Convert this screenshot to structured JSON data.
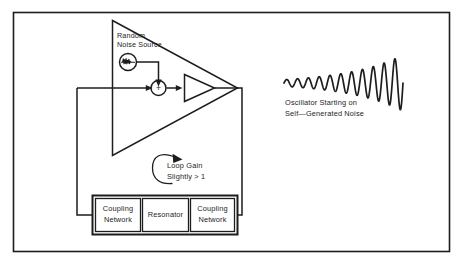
{
  "figure": {
    "frame": {
      "name": "outer-border",
      "stroke_color": "#3a3a3a",
      "x": 13,
      "y": 12,
      "width": 437,
      "height": 240
    },
    "background_color": "#ffffff",
    "ink_color": "#1d1d1d"
  },
  "labels": {
    "noise_source": {
      "line1": "Random",
      "line2": "Noise Source"
    },
    "loop_gain": {
      "line1": "Loop Gain",
      "line2": "Slightly > 1"
    },
    "waveform_caption": {
      "line1": "Oscillator Starting on",
      "line2": "Self—Generated Noise"
    },
    "summing_node_symbol": "+"
  },
  "blocks": [
    {
      "id": "coupling-network-left",
      "line1": "Coupling",
      "line2": "Network"
    },
    {
      "id": "resonator",
      "line1": "Resonator",
      "line2": ""
    },
    {
      "id": "coupling-network-right",
      "line1": "Coupling",
      "line2": "Network"
    }
  ],
  "chart_data": {
    "type": "line",
    "xlabel": "",
    "ylabel": "",
    "grid": false,
    "legend": "none",
    "xlim": [
      0,
      1
    ],
    "ylim": [
      -1,
      1
    ],
    "envelope": {
      "start_amplitude": 0.12,
      "end_amplitude": 1.0,
      "growth": "exponential"
    },
    "cycles": 11,
    "x": [
      0.0,
      0.1,
      0.2,
      0.3,
      0.4,
      0.5,
      0.6,
      0.7,
      0.8,
      0.9,
      1.0
    ],
    "y": [
      0.12,
      0.16,
      0.21,
      0.28,
      0.36,
      0.46,
      0.58,
      0.7,
      0.82,
      0.92,
      1.0
    ]
  }
}
